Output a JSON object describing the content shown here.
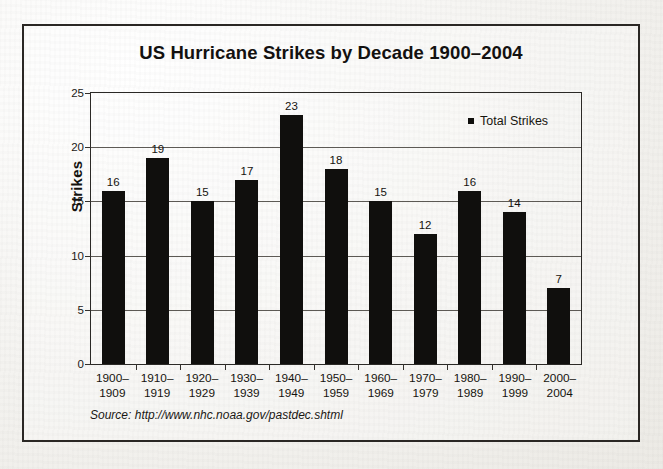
{
  "chart_data": {
    "type": "bar",
    "title": "US Hurricane Strikes by Decade 1900–2004",
    "xlabel": "",
    "ylabel": "Strikes",
    "ylim": [
      0,
      25
    ],
    "yticks": [
      0,
      5,
      10,
      15,
      20,
      25
    ],
    "grid": true,
    "legend_position": "top-right",
    "categories": [
      "1900–\n1909",
      "1910–\n1919",
      "1920–\n1929",
      "1930–\n1939",
      "1940–\n1949",
      "1950–\n1959",
      "1960–\n1969",
      "1970–\n1979",
      "1980–\n1989",
      "1990–\n1999",
      "2000–\n2004"
    ],
    "category_lines": [
      [
        "1900–",
        "1909"
      ],
      [
        "1910–",
        "1919"
      ],
      [
        "1920–",
        "1929"
      ],
      [
        "1930–",
        "1939"
      ],
      [
        "1940–",
        "1949"
      ],
      [
        "1950–",
        "1959"
      ],
      [
        "1960–",
        "1969"
      ],
      [
        "1970–",
        "1979"
      ],
      [
        "1980–",
        "1989"
      ],
      [
        "1990–",
        "1999"
      ],
      [
        "2000–",
        "2004"
      ]
    ],
    "series": [
      {
        "name": "Total Strikes",
        "values": [
          16,
          19,
          15,
          17,
          23,
          18,
          15,
          12,
          16,
          14,
          7
        ],
        "color": "#100f0d"
      }
    ],
    "bar_color": "#100f0d"
  },
  "legend": {
    "items": [
      {
        "label": "Total Strikes",
        "marker": "filled-square",
        "color": "#100f0d"
      }
    ]
  },
  "source": {
    "label": "Source:",
    "url": "http://www.nhc.noaa.gov/pastdec.shtml",
    "full_text": "Source: http://www.nhc.noaa.gov/pastdec.shtml"
  },
  "colors": {
    "ink": "#14120f",
    "frame": "#2a2724",
    "gridline": "#5d5a55",
    "bar": "#100f0d",
    "page_background": "#f2f1ee"
  }
}
